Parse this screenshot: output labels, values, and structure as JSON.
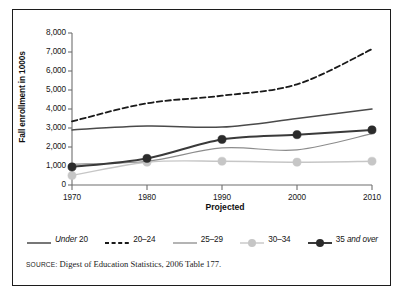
{
  "chart_data": {
    "type": "line",
    "title": "",
    "xlabel": "Projected",
    "ylabel": "Fall enrollment in 1000s",
    "categories": [
      "1970",
      "1980",
      "1990",
      "2000",
      "2010"
    ],
    "x": [
      1970,
      1980,
      1990,
      2000,
      2010
    ],
    "xlim": [
      1970,
      2010
    ],
    "ylim": [
      0,
      8000
    ],
    "yticks": [
      "0",
      "1,000",
      "2,000",
      "3,000",
      "4,000",
      "5,000",
      "6,000",
      "7,000",
      "8,000"
    ],
    "ytick_values": [
      0,
      1000,
      2000,
      3000,
      4000,
      5000,
      6000,
      7000,
      8000
    ],
    "xticks": [
      "1970",
      "1980",
      "1990",
      "2000",
      "2010"
    ],
    "grid": false,
    "legend_position": "bottom",
    "series": [
      {
        "name": "Under 20",
        "name_italic_part": "Under",
        "name_upright_part": "20",
        "style": "solid",
        "color": "#4a4a4a",
        "width": 1.5,
        "markers": false,
        "values": [
          2900,
          3100,
          3050,
          3500,
          4000
        ]
      },
      {
        "name": "20–24",
        "style": "dashed",
        "color": "#1a1a1a",
        "width": 1.8,
        "markers": false,
        "values": [
          3350,
          4300,
          4700,
          5300,
          7150
        ]
      },
      {
        "name": "25–29",
        "style": "solid",
        "color": "#8c8c8c",
        "width": 1.2,
        "markers": false,
        "values": [
          1100,
          1250,
          1950,
          1850,
          2700
        ]
      },
      {
        "name": "30–34",
        "style": "solid",
        "color": "#c6c6c6",
        "width": 1.4,
        "markers": true,
        "marker_color": "#c6c6c6",
        "values": [
          500,
          1200,
          1250,
          1200,
          1250
        ]
      },
      {
        "name": "35 and over",
        "name_upright_part": "35",
        "name_italic_part": "and over",
        "style": "solid",
        "color": "#3a3a3a",
        "width": 2.0,
        "markers": true,
        "marker_color": "#2b2b2b",
        "values": [
          950,
          1400,
          2400,
          2650,
          2900
        ]
      }
    ]
  },
  "source": {
    "prefix": "SOURCE:",
    "text": "Digest of Education Statistics, 2006 Table 177."
  },
  "colors": {
    "frame": "#1c1c1c",
    "axis": "#6f6f6f",
    "text": "#161616",
    "background": "#ffffff"
  }
}
